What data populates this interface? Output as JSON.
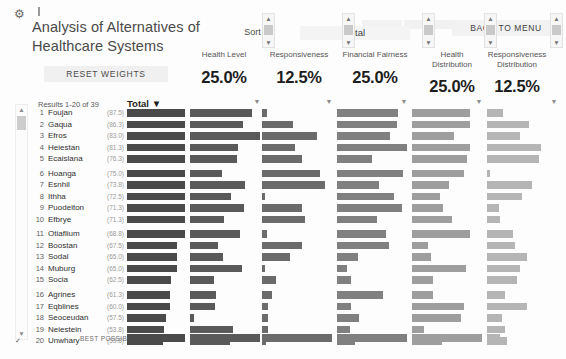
{
  "window": {
    "icon": "settings-gear-icon",
    "caret": "text-cursor"
  },
  "header": {
    "title": "Analysis of Alternatives of Healthcare Systems",
    "reset_label": "RESET WEIGHTS",
    "back_label": "BACK TO MENU",
    "sort_by_label": "Sort By",
    "sort_by_value": "Total"
  },
  "criteria": [
    {
      "name": "Health Level",
      "weight": "25.0%",
      "x": 188,
      "w": 72,
      "spin_x": 262
    },
    {
      "name": "Responsiveness",
      "weight": "12.5%",
      "x": 258,
      "w": 82,
      "spin_x": 342
    },
    {
      "name": "Financial Fairness",
      "weight": "25.0%",
      "x": 330,
      "w": 90,
      "spin_x": 422
    },
    {
      "name": "Health Distribution",
      "weight": "25.0%",
      "x": 423,
      "w": 58,
      "spin_x": 484
    },
    {
      "name": "Responsiveness Distribution",
      "weight": "12.5%",
      "x": 481,
      "w": 72,
      "spin_x": 550
    }
  ],
  "table": {
    "results_label": "Results 1-20 of 39",
    "total_header": "Total ▼",
    "best_label": "BEST POSSIBLE",
    "columns": [
      {
        "key": "total",
        "x": 127,
        "max": 58,
        "color": "#4a4a4a"
      },
      {
        "key": "health",
        "x": 190,
        "max": 70,
        "color": "#5a5a5a"
      },
      {
        "key": "resp",
        "x": 262,
        "max": 70,
        "color": "#6b6b6b"
      },
      {
        "key": "fin",
        "x": 337,
        "max": 70,
        "color": "#808080"
      },
      {
        "key": "hdist",
        "x": 412,
        "max": 70,
        "color": "#9e9e9e"
      },
      {
        "key": "rdist",
        "x": 487,
        "max": 70,
        "color": "#b5b5b5"
      }
    ],
    "rows": [
      {
        "rank": "1",
        "name": "Foujan",
        "score": "(87.5)",
        "checked": false,
        "gap": false,
        "bars": {
          "total": 58,
          "health": 62,
          "resp": 5,
          "fin": 61,
          "hdist": 58,
          "rdist": 16
        }
      },
      {
        "rank": "2",
        "name": "Gaqua",
        "score": "(86.3)",
        "checked": false,
        "gap": false,
        "bars": {
          "total": 58,
          "health": 53,
          "resp": 31,
          "fin": 60,
          "hdist": 58,
          "rdist": 42
        }
      },
      {
        "rank": "3",
        "name": "Efros",
        "score": "(83.0)",
        "checked": false,
        "gap": false,
        "bars": {
          "total": 58,
          "health": 70,
          "resp": 55,
          "fin": 53,
          "hdist": 42,
          "rdist": 33
        }
      },
      {
        "rank": "4",
        "name": "Heiestan",
        "score": "(81.3)",
        "checked": false,
        "gap": false,
        "bars": {
          "total": 58,
          "health": 48,
          "resp": 33,
          "fin": 70,
          "hdist": 58,
          "rdist": 54
        }
      },
      {
        "rank": "5",
        "name": "Ecaislana",
        "score": "(76.3)",
        "checked": false,
        "gap": false,
        "bars": {
          "total": 58,
          "health": 47,
          "resp": 40,
          "fin": 35,
          "hdist": 55,
          "rdist": 52
        }
      },
      {
        "rank": "6",
        "name": "Hoanga",
        "score": "(75.0)",
        "checked": false,
        "gap": true,
        "bars": {
          "total": 58,
          "health": 32,
          "resp": 58,
          "fin": 66,
          "hdist": 52,
          "rdist": 3
        }
      },
      {
        "rank": "7",
        "name": "Esnhil",
        "score": "(73.8)",
        "checked": false,
        "gap": false,
        "bars": {
          "total": 58,
          "health": 55,
          "resp": 63,
          "fin": 42,
          "hdist": 37,
          "rdist": 45
        }
      },
      {
        "rank": "8",
        "name": "Ithha",
        "score": "(72.5)",
        "checked": false,
        "gap": false,
        "bars": {
          "total": 58,
          "health": 41,
          "resp": 3,
          "fin": 57,
          "hdist": 28,
          "rdist": 35
        }
      },
      {
        "rank": "9",
        "name": "Puodeiton",
        "score": "(71.3)",
        "checked": false,
        "gap": false,
        "bars": {
          "total": 58,
          "health": 54,
          "resp": 40,
          "fin": 65,
          "hdist": 31,
          "rdist": 12
        }
      },
      {
        "rank": "10",
        "name": "Efbrye",
        "score": "(71.3)",
        "checked": false,
        "gap": false,
        "bars": {
          "total": 58,
          "health": 34,
          "resp": 43,
          "fin": 40,
          "hdist": 40,
          "rdist": 13
        }
      },
      {
        "rank": "11",
        "name": "Otiaflium",
        "score": "(68.8)",
        "checked": false,
        "gap": true,
        "bars": {
          "total": 58,
          "health": 50,
          "resp": 5,
          "fin": 49,
          "hdist": 58,
          "rdist": 26
        }
      },
      {
        "rank": "12",
        "name": "Boostan",
        "score": "(67.5)",
        "checked": false,
        "gap": false,
        "bars": {
          "total": 50,
          "health": 28,
          "resp": 40,
          "fin": 52,
          "hdist": 16,
          "rdist": 28
        }
      },
      {
        "rank": "13",
        "name": "Sodal",
        "score": "(65.0)",
        "checked": false,
        "gap": false,
        "bars": {
          "total": 50,
          "health": 33,
          "resp": 28,
          "fin": 21,
          "hdist": 19,
          "rdist": 40
        }
      },
      {
        "rank": "14",
        "name": "Muburg",
        "score": "(65.0)",
        "checked": false,
        "gap": false,
        "bars": {
          "total": 50,
          "health": 52,
          "resp": 3,
          "fin": 10,
          "hdist": 54,
          "rdist": 33
        }
      },
      {
        "rank": "15",
        "name": "Socia",
        "score": "(62.5)",
        "checked": false,
        "gap": false,
        "bars": {
          "total": 44,
          "health": 24,
          "resp": 14,
          "fin": 14,
          "hdist": 21,
          "rdist": 30
        }
      },
      {
        "rank": "16",
        "name": "Agrines",
        "score": "(61.3)",
        "checked": false,
        "gap": true,
        "bars": {
          "total": 43,
          "health": 26,
          "resp": 10,
          "fin": 46,
          "hdist": 21,
          "rdist": 18
        }
      },
      {
        "rank": "17",
        "name": "Eqblines",
        "score": "(60.0)",
        "checked": false,
        "gap": false,
        "bars": {
          "total": 43,
          "health": 25,
          "resp": 6,
          "fin": 14,
          "hdist": 52,
          "rdist": 40
        }
      },
      {
        "rank": "18",
        "name": "Seoceudan",
        "score": "(57.5)",
        "checked": false,
        "gap": false,
        "bars": {
          "total": 39,
          "health": 4,
          "resp": 6,
          "fin": 22,
          "hdist": 49,
          "rdist": 15
        }
      },
      {
        "rank": "19",
        "name": "Neiestein",
        "score": "(53.8)",
        "checked": false,
        "gap": false,
        "bars": {
          "total": 37,
          "health": 43,
          "resp": 6,
          "fin": 13,
          "hdist": 12,
          "rdist": 18
        }
      },
      {
        "rank": "20",
        "name": "Unwhary",
        "score": "(53.8)",
        "checked": true,
        "gap": false,
        "bars": {
          "total": 36,
          "health": 40,
          "resp": 4,
          "fin": 18,
          "hdist": 30,
          "rdist": 20
        }
      }
    ],
    "best_possible": {
      "total": 58,
      "health": 70,
      "resp": 70,
      "fin": 70,
      "hdist": 70,
      "rdist": 13
    }
  },
  "colors": {
    "bar_dark": "#4a4a4a",
    "bar_light": "#b5b5b5",
    "panel": "#f2f2f2"
  }
}
